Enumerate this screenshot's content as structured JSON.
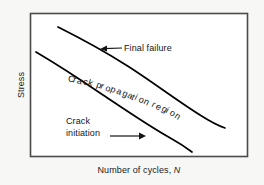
{
  "figure": {
    "background_color": "#f7f7f5",
    "frame_color": "#4a4a4a",
    "curve_color": "#000000",
    "text_color": "#141414"
  },
  "axes": {
    "y_label": "Stress",
    "x_label_text": "Number of cycles,",
    "x_label_symbol": "N"
  },
  "annotations": {
    "final_failure": "Final failure",
    "crack_initiation_line1": "Crack",
    "crack_initiation_line2": "initiation",
    "crack_propagation": "Crack propagation region"
  },
  "chart_data": {
    "type": "line",
    "title": "",
    "xlabel": "Number of cycles, N",
    "ylabel": "Stress",
    "grid": false,
    "legend": "none",
    "axis_ticks": [],
    "series": [
      {
        "name": "Final failure",
        "points": [
          [
            58,
            27
          ],
          [
            84,
            40
          ],
          [
            112,
            56
          ],
          [
            142,
            76
          ],
          [
            172,
            97
          ],
          [
            200,
            115
          ],
          [
            225,
            128
          ]
        ]
      },
      {
        "name": "Crack initiation",
        "points": [
          [
            36,
            52
          ],
          [
            62,
            68
          ],
          [
            90,
            86
          ],
          [
            118,
            105
          ],
          [
            148,
            125
          ],
          [
            172,
            139
          ],
          [
            192,
            152
          ]
        ]
      }
    ],
    "arrows": [
      {
        "name": "final-failure-arrow",
        "direction": "left",
        "from": [
          122,
          47
        ],
        "to": [
          101,
          49
        ]
      },
      {
        "name": "crack-initiation-arrow",
        "direction": "right",
        "from": [
          110,
          136
        ],
        "to": [
          146,
          136
        ]
      }
    ],
    "curved_label": {
      "text": "Crack propagation region",
      "start": [
        63,
        72
      ],
      "end": [
        176,
        110
      ]
    }
  }
}
